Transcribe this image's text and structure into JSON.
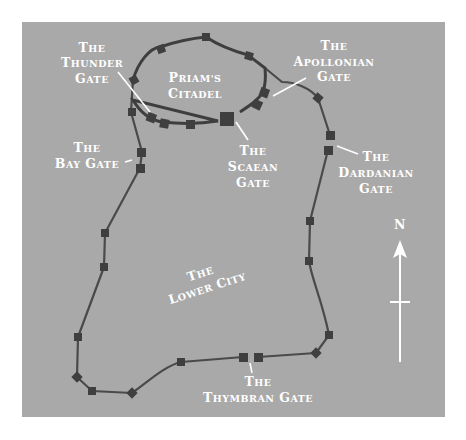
{
  "map": {
    "background_color": "#a9a9a9",
    "wall_color": "#4a4a4a",
    "label_color": "#ffffff",
    "regions": {
      "citadel": {
        "line1": "Priam's",
        "line2": "Citadel"
      },
      "lower_city": {
        "line1": "The",
        "line2": "Lower City"
      }
    },
    "gates": [
      {
        "id": "thunder",
        "line1": "The",
        "line2": "Thunder",
        "line3": "gate"
      },
      {
        "id": "apollonian",
        "line1": "The",
        "line2": "Apollonian",
        "line3": "Gate"
      },
      {
        "id": "bay",
        "line1": "The",
        "line2": "Bay Gate"
      },
      {
        "id": "scaean",
        "line1": "The",
        "line2": "Scaean",
        "line3": "Gate"
      },
      {
        "id": "dardanian",
        "line1": "The",
        "line2": "Dardanian",
        "line3": "Gate"
      },
      {
        "id": "thymbran",
        "line1": "The",
        "line2": "Thymbran Gate"
      }
    ],
    "compass": {
      "label": "N",
      "icon": "north-arrow-icon"
    }
  }
}
